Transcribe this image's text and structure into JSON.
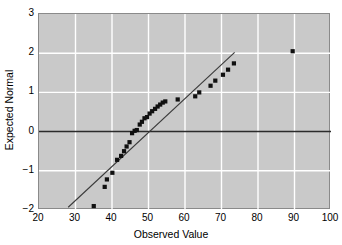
{
  "chart_data": {
    "type": "scatter",
    "title": "",
    "xlabel": "Observed Value",
    "ylabel": "Expected Normal",
    "xlim": [
      20,
      100
    ],
    "ylim": [
      -2,
      3
    ],
    "xticks": [
      20,
      30,
      40,
      50,
      60,
      70,
      80,
      90,
      100
    ],
    "yticks": [
      -2,
      -1,
      0,
      1,
      2,
      3
    ],
    "grid": true,
    "legend": null,
    "background_color": "#c9c9c9",
    "grid_color": "#ffffff",
    "marker_color": "#101010",
    "line_color": "#3a3a3a",
    "zero_line_color": "#2b2b2b",
    "zero_line_y": 0,
    "series": [
      {
        "name": "Q-Q points",
        "marker": "square",
        "points": [
          [
            35.0,
            -1.9
          ],
          [
            38.0,
            -1.41
          ],
          [
            38.6,
            -1.22
          ],
          [
            40.1,
            -1.05
          ],
          [
            41.4,
            -0.72
          ],
          [
            42.5,
            -0.62
          ],
          [
            43.3,
            -0.5
          ],
          [
            44.0,
            -0.38
          ],
          [
            44.8,
            -0.27
          ],
          [
            45.5,
            -0.04
          ],
          [
            46.2,
            0.02
          ],
          [
            46.8,
            0.04
          ],
          [
            47.6,
            0.18
          ],
          [
            48.2,
            0.25
          ],
          [
            48.9,
            0.34
          ],
          [
            49.6,
            0.37
          ],
          [
            50.3,
            0.46
          ],
          [
            51.0,
            0.52
          ],
          [
            51.8,
            0.58
          ],
          [
            52.5,
            0.64
          ],
          [
            53.2,
            0.69
          ],
          [
            53.9,
            0.74
          ],
          [
            54.6,
            0.77
          ],
          [
            58.0,
            0.82
          ],
          [
            62.8,
            0.9
          ],
          [
            63.9,
            1.0
          ],
          [
            67.0,
            1.17
          ],
          [
            68.3,
            1.3
          ],
          [
            70.4,
            1.45
          ],
          [
            71.8,
            1.58
          ],
          [
            73.4,
            1.74
          ]
        ]
      },
      {
        "name": "Reference line",
        "marker": "none",
        "line": [
          [
            28.0,
            -1.93
          ],
          [
            73.6,
            2.02
          ]
        ]
      },
      {
        "name": "Outlier",
        "marker": "square",
        "points": [
          [
            89.5,
            2.05
          ]
        ]
      }
    ]
  }
}
